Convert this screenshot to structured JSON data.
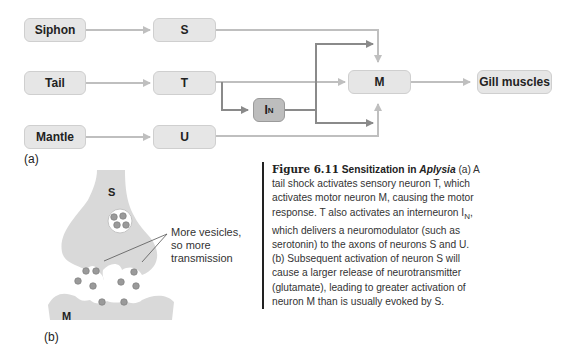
{
  "diagram_a": {
    "panel_label": "(a)",
    "inputs": [
      {
        "id": "siphon",
        "label": "Siphon"
      },
      {
        "id": "tail",
        "label": "Tail"
      },
      {
        "id": "mantle",
        "label": "Mantle"
      }
    ],
    "sensory_neurons": [
      {
        "id": "s",
        "label": "S"
      },
      {
        "id": "t",
        "label": "T"
      },
      {
        "id": "u",
        "label": "U"
      }
    ],
    "interneuron": {
      "label": "I",
      "subscript": "N"
    },
    "motor_neuron": {
      "label": "M"
    },
    "output": {
      "label": "Gill muscles"
    },
    "colors": {
      "box_fill": "#e6e6e6",
      "interneuron_fill": "#bdbdbd",
      "light_arrow": "#bfbfbf",
      "dark_arrow": "#8a8a8a"
    }
  },
  "diagram_b": {
    "panel_label": "(b)",
    "presynaptic_label": "S",
    "postsynaptic_label": "M",
    "callout": [
      "More vesicles,",
      "so more",
      "transmission"
    ]
  },
  "caption": {
    "figure_number": "Figure 6.11",
    "title": "Sensitization",
    "title_in": "in",
    "organism": "Aplysia",
    "body_1": "(a) A tail shock activates sensory neuron T, which activates motor neuron M, causing the motor response. T also activates an interneuron I",
    "body_sub": "N",
    "body_2": ", which delivers a neuromodulator (such as serotonin) to the axons of neurons S and U. (b) Subsequent activation of neuron S will cause a larger release of neurotransmitter (glutamate), leading to greater activation of neuron M than is usually evoked by S."
  }
}
